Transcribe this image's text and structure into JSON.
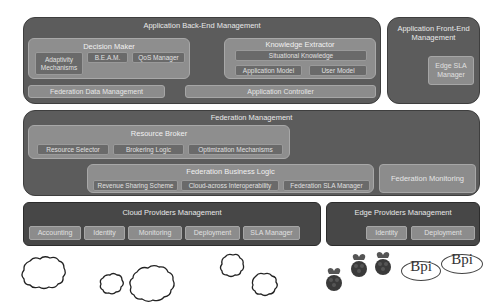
{
  "backend": {
    "title": "Application Back-End Management",
    "decision_maker": {
      "title": "Decision Maker",
      "items": [
        "Adaptivity Mechanisms",
        "B.E.A.M.",
        "QoS Manager"
      ]
    },
    "knowledge_extractor": {
      "title": "Knowledge Extractor",
      "situational": "Situational Knowledge",
      "items": [
        "Application Model",
        "User Model"
      ]
    },
    "federation_data": "Federation Data Management",
    "app_controller": "Application Controller"
  },
  "frontend": {
    "title": "Application Front-End Management",
    "edge_sla": "Edge SLA Manager"
  },
  "federation": {
    "title": "Federation Management",
    "resource_broker": {
      "title": "Resource Broker",
      "items": [
        "Resource Selector",
        "Brokering Logic",
        "Optimization Mechanisms"
      ]
    },
    "business_logic": {
      "title": "Federation Business Logic",
      "items": [
        "Revenue Sharing Scheme",
        "Cloud-across Interoperability",
        "Federation SLA Manager"
      ]
    },
    "monitoring": "Federation Monitoring"
  },
  "cloud": {
    "title": "Cloud Providers Management",
    "items": [
      "Accounting",
      "Identity",
      "Monitoring",
      "Deployment",
      "SLA Manager"
    ]
  },
  "edge": {
    "title": "Edge Providers Management",
    "items": [
      "Identity",
      "Deployment"
    ]
  },
  "devices": {
    "bpi_label": "Bpi"
  }
}
